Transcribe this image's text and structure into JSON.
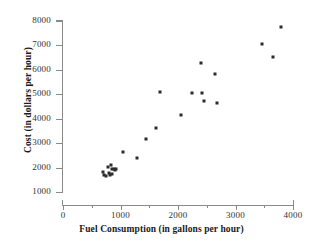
{
  "chart_data": {
    "type": "scatter",
    "title": "",
    "xlabel": "Fuel Consumption (in gallons per hour)",
    "ylabel": "Cost (in dollars per hour)",
    "xlim": [
      0,
      4000
    ],
    "ylim": [
      1000,
      8000
    ],
    "x_ticks": [
      0,
      1000,
      2000,
      3000,
      4000
    ],
    "x_tick_labels": [
      "0",
      "1000",
      "2000",
      "3000",
      "4000"
    ],
    "x_minor_ticks": [
      500,
      1500,
      2500,
      3500
    ],
    "y_ticks": [
      1000,
      2000,
      3000,
      4000,
      5000,
      6000,
      7000,
      8000
    ],
    "y_tick_labels": [
      "1000",
      "2000",
      "3000",
      "4000",
      "5000",
      "6000",
      "7000",
      "8000"
    ],
    "grid": false,
    "legend": null,
    "marker": "square",
    "marker_color": "#2b2b2b",
    "points": [
      {
        "x": 700,
        "y": 1830
      },
      {
        "x": 720,
        "y": 1700
      },
      {
        "x": 745,
        "y": 1640
      },
      {
        "x": 780,
        "y": 2020
      },
      {
        "x": 800,
        "y": 1760
      },
      {
        "x": 815,
        "y": 1680
      },
      {
        "x": 835,
        "y": 2090
      },
      {
        "x": 850,
        "y": 1930
      },
      {
        "x": 860,
        "y": 1720
      },
      {
        "x": 880,
        "y": 1960
      },
      {
        "x": 900,
        "y": 1890
      },
      {
        "x": 915,
        "y": 1930
      },
      {
        "x": 1050,
        "y": 2620
      },
      {
        "x": 1290,
        "y": 2380
      },
      {
        "x": 1440,
        "y": 3170
      },
      {
        "x": 1620,
        "y": 3600
      },
      {
        "x": 1690,
        "y": 5110
      },
      {
        "x": 2050,
        "y": 4170
      },
      {
        "x": 2240,
        "y": 5070
      },
      {
        "x": 2400,
        "y": 6300
      },
      {
        "x": 2420,
        "y": 5060
      },
      {
        "x": 2450,
        "y": 4730
      },
      {
        "x": 2650,
        "y": 5810
      },
      {
        "x": 2680,
        "y": 4660
      },
      {
        "x": 3460,
        "y": 7040
      },
      {
        "x": 3660,
        "y": 6540
      },
      {
        "x": 3790,
        "y": 7740
      }
    ]
  }
}
